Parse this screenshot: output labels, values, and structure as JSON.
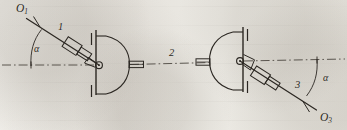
{
  "figure": {
    "background_color": "#e8e6e1",
    "ink_color": "#2b2722"
  },
  "labels": {
    "pivot_left": {
      "letter": "O",
      "subscript": "1",
      "name": "O1"
    },
    "pivot_right": {
      "letter": "O",
      "subscript": "3",
      "name": "O3"
    },
    "link_1": "1",
    "link_2": "2",
    "link_3": "3",
    "angle_left": "α",
    "angle_right": "α"
  },
  "geometry": {
    "centerline_y": 65,
    "left_hub_center": {
      "x": 99,
      "y": 65
    },
    "right_hub_center": {
      "x": 240,
      "y": 61
    },
    "left_arm_end": {
      "x": 27,
      "y": 18
    },
    "right_arm_end": {
      "x": 316,
      "y": 110
    },
    "angle_vertex_left": {
      "x": 31,
      "y": 65
    },
    "angle_vertex_right": {
      "x": 317,
      "y": 60
    },
    "line_style_centerline": "dash-dot",
    "line_style_links": "solid"
  },
  "components": [
    {
      "name": "left-angled-link",
      "label": "1"
    },
    {
      "name": "center-horizontal-link",
      "label": "2"
    },
    {
      "name": "right-angled-link",
      "label": "3"
    },
    {
      "name": "left-hub-assembly",
      "label": ""
    },
    {
      "name": "right-hub-assembly",
      "label": ""
    }
  ]
}
